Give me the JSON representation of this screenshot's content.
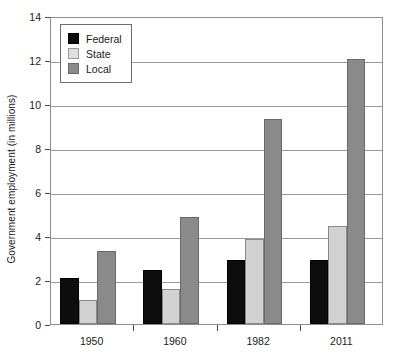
{
  "chart_data": {
    "type": "bar",
    "title": "",
    "subtitle": "",
    "xlabel": "",
    "ylabel": "Government employment (in millions)",
    "categories": [
      "1950",
      "1960",
      "1982",
      "2011"
    ],
    "series": [
      {
        "name": "Federal",
        "color": "#0d0d0d",
        "values": [
          2.1,
          2.45,
          2.9,
          2.9
        ]
      },
      {
        "name": "State",
        "color": "#d2d2d2",
        "values": [
          1.1,
          1.6,
          3.85,
          4.45
        ]
      },
      {
        "name": "Local",
        "color": "#8a8a8a",
        "values": [
          3.3,
          4.85,
          9.3,
          12.05
        ]
      }
    ],
    "ylim": [
      0,
      14
    ],
    "yticks": [
      0,
      2,
      4,
      6,
      8,
      10,
      12,
      14
    ],
    "ytick_labels": [
      "0",
      "2",
      "4",
      "6",
      "8",
      "10",
      "12",
      "14"
    ],
    "grid": true,
    "grid_axis": "y",
    "legend_position": "upper-left-inside",
    "legend_entries": [
      "Federal",
      "State",
      "Local"
    ]
  }
}
